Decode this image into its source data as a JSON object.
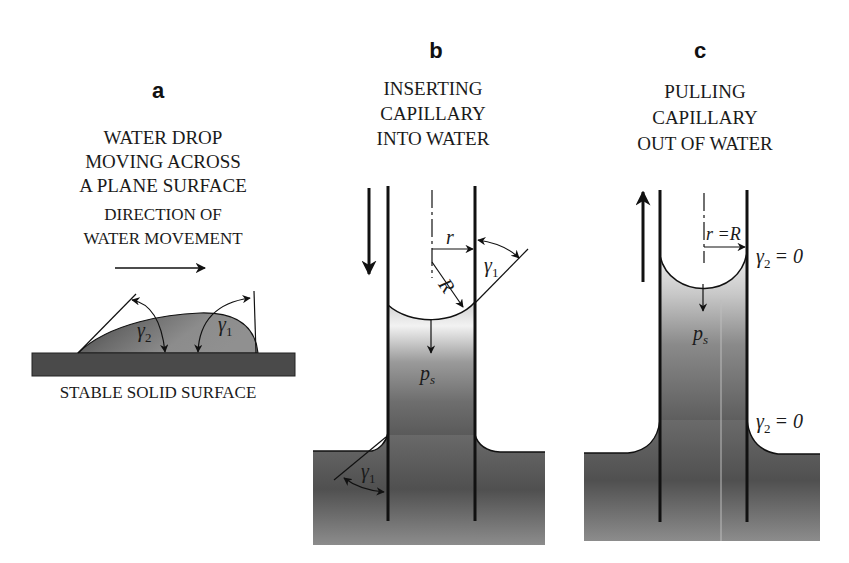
{
  "figure": {
    "panels": [
      {
        "id": "a",
        "label": "a",
        "title_lines": [
          "WATER DROP",
          "MOVING ACROSS",
          "A PLANE SURFACE"
        ],
        "direction_lines": [
          "DIRECTION OF",
          "WATER MOVEMENT"
        ],
        "surface_label": "STABLE SOLID  SURFACE",
        "angle_labels": {
          "left": {
            "sym": "γ",
            "sub": "2"
          },
          "right": {
            "sym": "γ",
            "sub": "1"
          }
        }
      },
      {
        "id": "b",
        "label": "b",
        "title_lines": [
          "INSERTING",
          "CAPILLARY",
          "INTO WATER"
        ],
        "symbols": {
          "r": "r",
          "R": "R",
          "gamma_top": {
            "sym": "γ",
            "sub": "1"
          },
          "ps": {
            "sym": "p",
            "sub": "s"
          },
          "gamma_bottom": {
            "sym": "γ",
            "sub": "1"
          }
        },
        "motion": "down"
      },
      {
        "id": "c",
        "label": "c",
        "title_lines": [
          "PULLING",
          "CAPILLARY",
          "OUT OF WATER"
        ],
        "symbols": {
          "rR": "r =R",
          "gamma_top": {
            "sym": "γ",
            "sub": "2",
            "eq": "= 0"
          },
          "ps": {
            "sym": "p",
            "sub": "s"
          },
          "gamma_bottom": {
            "sym": "γ",
            "sub": "2",
            "eq": "= 0"
          }
        },
        "motion": "up"
      }
    ],
    "colors": {
      "line": "#111111",
      "water_dark": "#5a5a5a",
      "water_mid": "#8a8a8a",
      "water_light": "#d8d8d8",
      "surface": "#4a4a4a",
      "background": "#ffffff"
    }
  }
}
